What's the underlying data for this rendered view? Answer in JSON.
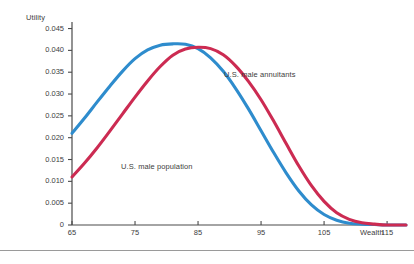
{
  "chart_data": {
    "type": "line",
    "title": "",
    "xlabel": "Wealth",
    "ylabel": "Utility",
    "xlim": [
      65,
      118
    ],
    "ylim": [
      0,
      0.0465
    ],
    "grid": false,
    "legend_position": "inline-annotation",
    "xticks": [
      65,
      75,
      85,
      95,
      105,
      115
    ],
    "xticklabels": [
      "65",
      "75",
      "85",
      "95",
      "105",
      "115"
    ],
    "yticks": [
      0,
      0.005,
      0.01,
      0.015,
      0.02,
      0.025,
      0.03,
      0.035,
      0.04,
      0.045
    ],
    "yticklabels": [
      "0",
      "0.005",
      "0.010",
      "0.015",
      "0.020",
      "0.025",
      "0.030",
      "0.035",
      "0.040",
      "0.045"
    ],
    "series": [
      {
        "name": "U.S. male population",
        "color": "#2e8ccd",
        "peak_x": 83,
        "peak_y": 0.0415,
        "x": [
          65,
          67,
          69,
          71,
          73,
          75,
          77,
          79,
          81,
          83,
          85,
          87,
          89,
          91,
          93,
          95,
          97,
          99,
          101,
          103,
          105,
          107,
          109,
          111,
          113,
          115,
          118
        ],
        "values": [
          0.021,
          0.0245,
          0.0282,
          0.0318,
          0.0352,
          0.0381,
          0.0401,
          0.0412,
          0.0415,
          0.0414,
          0.0404,
          0.0383,
          0.0352,
          0.0312,
          0.0266,
          0.0216,
          0.0166,
          0.0119,
          0.0078,
          0.0046,
          0.0024,
          0.0011,
          0.0004,
          0.0002,
          0.0001,
          0.0,
          0.0
        ]
      },
      {
        "name": "U.S. male annuitants",
        "color": "#cc2b52",
        "peak_x": 86,
        "peak_y": 0.0407,
        "x": [
          65,
          67,
          69,
          71,
          73,
          75,
          77,
          79,
          81,
          83,
          85,
          87,
          89,
          91,
          93,
          95,
          97,
          99,
          101,
          103,
          105,
          107,
          109,
          111,
          113,
          115,
          118
        ],
        "values": [
          0.011,
          0.0142,
          0.0177,
          0.0215,
          0.0254,
          0.0293,
          0.033,
          0.0363,
          0.0389,
          0.0403,
          0.0407,
          0.0404,
          0.039,
          0.0364,
          0.0329,
          0.0287,
          0.0238,
          0.0186,
          0.0135,
          0.009,
          0.0054,
          0.0028,
          0.0013,
          0.0005,
          0.0002,
          0.0,
          0.0
        ]
      }
    ],
    "annotations": [
      {
        "text": "U.S. male annuitants",
        "x": 95.5,
        "y": 0.0365
      },
      {
        "text": "U.S. male population",
        "x": 76.0,
        "y": 0.0155
      }
    ]
  },
  "axes": {
    "y_title": "Utility",
    "x_title": "Wealth"
  }
}
